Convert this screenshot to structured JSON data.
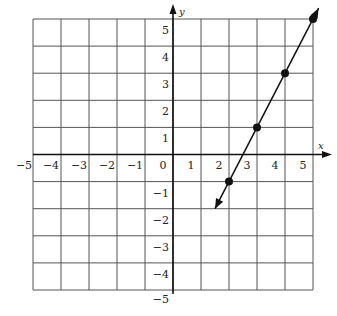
{
  "chart_data": {
    "type": "line",
    "title": "",
    "xlabel": "x",
    "ylabel": "y",
    "xlim": [
      -5,
      5
    ],
    "ylim": [
      -5,
      5
    ],
    "grid": true,
    "x_ticks": [
      "-5",
      "-4",
      "-3",
      "-2",
      "-1",
      "0",
      "1",
      "2",
      "3",
      "4",
      "5"
    ],
    "y_ticks": [
      "5",
      "4",
      "3",
      "2",
      "1",
      "-1",
      "-2",
      "-3",
      "-4",
      "-5"
    ],
    "series": [
      {
        "name": "line",
        "equation": "y = 2x - 5",
        "points": [
          [
            2,
            -1
          ],
          [
            3,
            1
          ],
          [
            4,
            3
          ],
          [
            5,
            5
          ]
        ],
        "extends_both_directions": true
      }
    ]
  },
  "labels": {
    "x_axis": "x",
    "y_axis": "y"
  }
}
